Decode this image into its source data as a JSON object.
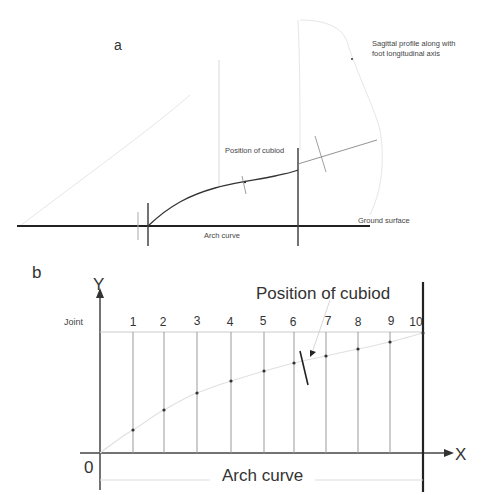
{
  "panel_a": {
    "label": "a",
    "annotation_profile_line1": "Sagittal profile along with",
    "annotation_profile_line2": "foot longitudinal  axis",
    "annotation_cuboid": "Position of cubiod",
    "annotation_ground": "Ground surface",
    "annotation_arch": "Arch curve"
  },
  "panel_b": {
    "label": "b",
    "y_axis_label": "Y",
    "x_axis_label": "X",
    "origin_label": "0",
    "joint_row_label": "Joint",
    "cuboid_label": "Position of cubiod",
    "arch_label": "Arch curve",
    "joints": [
      "1",
      "2",
      "3",
      "4",
      "5",
      "6",
      "7",
      "8",
      "9",
      "10"
    ]
  },
  "colors": {
    "line_dark": "#222222",
    "line_mid": "#777777",
    "line_faint": "#dddddd",
    "text": "#333333"
  }
}
